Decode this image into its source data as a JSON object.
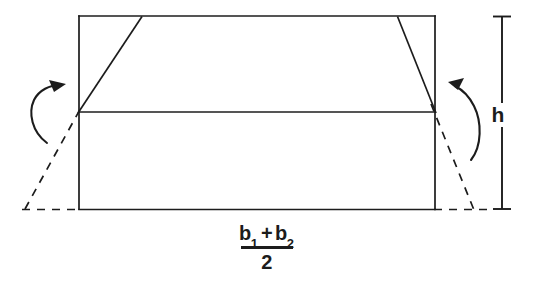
{
  "figure": {
    "background_color": "#ffffff",
    "stroke_color": "#1c1c1c",
    "labels": {
      "height": "h",
      "base_numerator_first": "b",
      "base_numerator_first_sub": "1",
      "base_plus": "+",
      "base_numerator_second": "b",
      "base_numerator_second_sub": "2",
      "base_denominator": "2"
    },
    "geometry": {
      "rectangle": {
        "x1": 79,
        "y1": 16,
        "x2": 435,
        "y2": 209
      },
      "midline": {
        "x1": 79,
        "y1": 112,
        "x2": 435,
        "y2": 112
      },
      "trapezoid_left_leg": {
        "x1": 79,
        "y1": 112,
        "x2": 141,
        "y2": 17
      },
      "trapezoid_right_leg": {
        "x1": 398,
        "y1": 17,
        "x2": 435,
        "y2": 112
      },
      "dashed_left_leg": {
        "x1": 25,
        "y1": 209,
        "x2": 82,
        "y2": 106
      },
      "dashed_right_leg": {
        "x1": 432,
        "y1": 106,
        "x2": 473,
        "y2": 209
      },
      "dashed_base_left": {
        "x1": 22,
        "y1": 209,
        "x2": 79,
        "y2": 209
      },
      "dashed_base_right": {
        "x1": 435,
        "y1": 209,
        "x2": 491,
        "y2": 209
      },
      "dimension_line": {
        "x": 502,
        "y1": 16,
        "y2": 209,
        "cap_half_width": 9
      }
    },
    "arrows": [
      {
        "name": "rotate-left-arrow",
        "direction": "counterclockwise-up"
      },
      {
        "name": "rotate-right-arrow",
        "direction": "clockwise-up"
      }
    ]
  }
}
